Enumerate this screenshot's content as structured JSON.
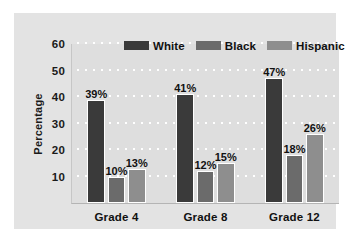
{
  "chart_data": {
    "type": "bar",
    "title": "",
    "xlabel": "",
    "ylabel": "Percentage",
    "categories": [
      "Grade 4",
      "Grade 8",
      "Grade 12"
    ],
    "series": [
      {
        "name": "White",
        "color": "#3a3a3a",
        "values": [
          39,
          41,
          47
        ],
        "labels": [
          "39%",
          "41%",
          "47%"
        ]
      },
      {
        "name": "Black",
        "color": "#6b6b6b",
        "values": [
          10,
          12,
          18
        ],
        "labels": [
          "10%",
          "12%",
          "18%"
        ]
      },
      {
        "name": "Hispanic",
        "color": "#8e8e8e",
        "values": [
          13,
          15,
          26
        ],
        "labels": [
          "13%",
          "15%",
          "26%"
        ]
      }
    ],
    "ylim": [
      0,
      60
    ],
    "yticks": [
      10,
      20,
      30,
      40,
      50,
      60
    ],
    "ytick_labels": [
      "10",
      "20",
      "30",
      "40",
      "50",
      "60"
    ],
    "grid": true,
    "grid_style": "dotted-horizontal",
    "legend_position": "top-center",
    "value_label_suffix": "%",
    "background_color": "#e3e3e3",
    "plot_background_color": "#dedede"
  }
}
